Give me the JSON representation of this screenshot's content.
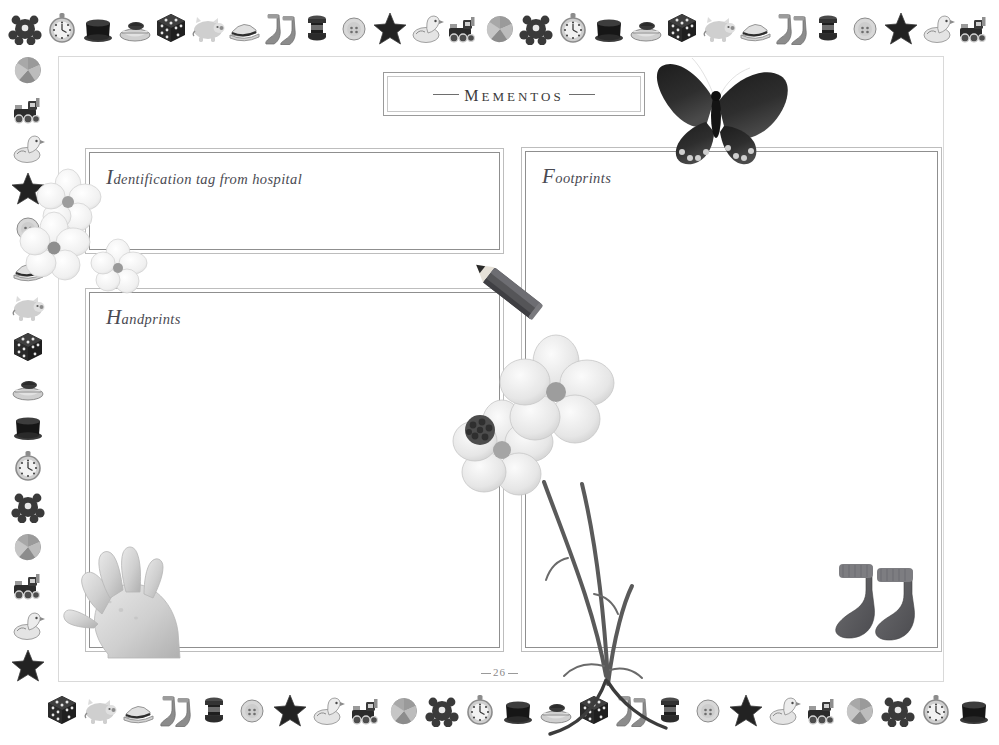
{
  "page": {
    "title": "Mementos",
    "title_dash_left": "dash",
    "title_dash_right": "dash",
    "page_number": "26"
  },
  "boxes": [
    {
      "key": "identification",
      "label": "Identification tag from hospital",
      "value": ""
    },
    {
      "key": "handprints",
      "label": "Handprints",
      "value": ""
    },
    {
      "key": "footprints",
      "label": "Footprints",
      "value": ""
    }
  ],
  "decorations": [
    {
      "name": "butterfly-photo"
    },
    {
      "name": "pencil-photo"
    },
    {
      "name": "baby-socks-photo"
    },
    {
      "name": "baby-hand-photo"
    },
    {
      "name": "flower-cluster-photo"
    },
    {
      "name": "flower-stems-photo"
    }
  ],
  "colors": {
    "page_background": "#ffffff",
    "frame_border": "#d9d9d9",
    "box_border_outer": "#bdbdbd",
    "box_border_inner": "#8f8f8f",
    "title_text": "#3a3a3a",
    "label_text": "#4a4a52",
    "page_number_text": "#8a8a8a",
    "toy_dark": "#3a3a3a",
    "toy_mid": "#8c8c8c",
    "toy_light": "#cfcfcf"
  },
  "border_icons": {
    "top": [
      "teddy-bear-icon",
      "pocket-watch-icon",
      "top-hat-icon",
      "boat-icon",
      "dice-icon",
      "piggy-bank-icon",
      "cap-icon",
      "socks-icon",
      "spool-icon",
      "button-icon",
      "star-icon",
      "duck-icon",
      "train-icon",
      "ball-icon",
      "teddy-bear-icon",
      "pocket-watch-icon",
      "top-hat-icon",
      "boat-icon",
      "dice-icon",
      "piggy-bank-icon",
      "cap-icon",
      "socks-icon",
      "spool-icon",
      "button-icon",
      "star-icon",
      "duck-icon",
      "train-icon"
    ],
    "left": [
      "ball-icon",
      "train-icon",
      "duck-icon",
      "star-icon",
      "button-icon",
      "cap-icon",
      "piggy-bank-icon",
      "dice-icon",
      "boat-icon",
      "top-hat-icon",
      "pocket-watch-icon",
      "teddy-bear-icon",
      "ball-icon",
      "train-icon",
      "duck-icon",
      "star-icon"
    ],
    "bottom": [
      "dice-icon",
      "piggy-bank-icon",
      "cap-icon",
      "socks-icon",
      "spool-icon",
      "button-icon",
      "star-icon",
      "duck-icon",
      "train-icon",
      "ball-icon",
      "teddy-bear-icon",
      "pocket-watch-icon",
      "top-hat-icon",
      "boat-icon",
      "dice-icon",
      "socks-icon",
      "spool-icon",
      "button-icon",
      "star-icon",
      "duck-icon",
      "train-icon",
      "ball-icon",
      "teddy-bear-icon",
      "pocket-watch-icon",
      "top-hat-icon"
    ]
  }
}
